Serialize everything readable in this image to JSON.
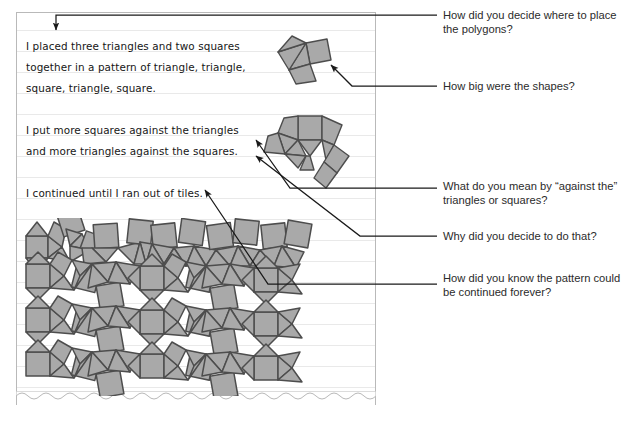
{
  "document": {
    "type": "student-work-sample",
    "paper": "lined notebook page with torn bottom edge"
  },
  "notebook": {
    "paragraphs": [
      {
        "id": "p1",
        "lines": [
          "I placed three triangles and two squares",
          "together in a pattern of triangle, triangle,",
          "square, triangle, square."
        ]
      },
      {
        "id": "p2",
        "lines": [
          "I put more squares against the triangles",
          "and more triangles against the squares."
        ]
      },
      {
        "id": "p3",
        "lines": [
          "I continued until I ran out of tiles."
        ]
      }
    ]
  },
  "figures": {
    "cluster_small": {
      "name": "five-polygon-cluster",
      "description": "three triangles and two squares joined in a fan"
    },
    "cluster_medium": {
      "name": "extended-polygon-arc",
      "description": "arc of alternating squares and triangles"
    },
    "tessellation": {
      "name": "snub-square-tessellation",
      "description": "3.3.4.3.4 tiling of triangles and squares filling the page"
    }
  },
  "questions": [
    {
      "id": "q1",
      "text": "How did you decide where to place the polygons?"
    },
    {
      "id": "q2",
      "text": "How big were the shapes?"
    },
    {
      "id": "q3",
      "text": "What do you mean by “against the” triangles or squares?"
    },
    {
      "id": "q4",
      "text": "Why did you decide to do that?"
    },
    {
      "id": "q5",
      "text": "How did you know the pattern could be continued forever?"
    }
  ],
  "colors": {
    "shape_fill": "#a9a9a9",
    "shape_stroke": "#4d4d4d",
    "page_border": "#b9b9b9",
    "rule_line": "#e9e9e9",
    "leader_line": "#1a1a1a",
    "ink": "#161616",
    "question_text": "#2b2b2b"
  }
}
